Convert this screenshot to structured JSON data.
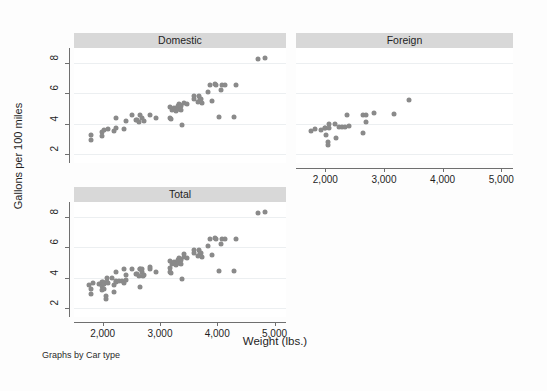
{
  "figure": {
    "note": "Graphs by Car type",
    "xtitle": "Weight (lbs.)",
    "ytitle": "Gallons per 100 miles",
    "bg_color": "#fdfdfd",
    "panel_header_color": "#d8d8d8",
    "marker_color": "#8a8a8a",
    "axis_color": "#6f6f6f",
    "grid_color": "#eceff1"
  },
  "axes": {
    "x": {
      "label": "Weight (lbs.)",
      "min": 1500,
      "max": 5200,
      "ticks": [
        2000,
        3000,
        4000,
        5000
      ],
      "tick_labels": [
        "2,000",
        "3,000",
        "4,000",
        "5,000"
      ]
    },
    "y": {
      "label": "Gallons per 100 miles",
      "min": 1.4,
      "max": 9.0,
      "ticks": [
        2,
        4,
        6,
        8
      ],
      "tick_labels": [
        "2",
        "4",
        "6",
        "8"
      ]
    }
  },
  "chart_data": {
    "type": "scatter",
    "title": "",
    "xlabel": "Weight (lbs.)",
    "ylabel": "Gallons per 100 miles",
    "xlim": [
      1500,
      5200
    ],
    "ylim": [
      1.4,
      9.0
    ],
    "xticks": [
      2000,
      3000,
      4000,
      5000
    ],
    "yticks": [
      2,
      4,
      6,
      8
    ],
    "grid": "horizontal",
    "legend": "none",
    "note": "Graphs by Car type",
    "panels": [
      {
        "name": "Domestic",
        "title": "Domestic",
        "show_y_axis": true,
        "show_x_axis": false,
        "points": [
          [
            1800,
            3.23
          ],
          [
            1800,
            2.95
          ],
          [
            1980,
            3.19
          ],
          [
            1980,
            3.47
          ],
          [
            2020,
            3.57
          ],
          [
            2100,
            3.66
          ],
          [
            2200,
            3.5
          ],
          [
            2230,
            3.72
          ],
          [
            2240,
            4.35
          ],
          [
            2370,
            3.66
          ],
          [
            2410,
            4.2
          ],
          [
            2520,
            4.55
          ],
          [
            2580,
            4.23
          ],
          [
            2600,
            4.23
          ],
          [
            2640,
            4.14
          ],
          [
            2650,
            4.55
          ],
          [
            2690,
            4.4
          ],
          [
            2730,
            4.16
          ],
          [
            2830,
            4.55
          ],
          [
            2930,
            4.38
          ],
          [
            3170,
            4.4
          ],
          [
            3180,
            5.1
          ],
          [
            3200,
            4.32
          ],
          [
            3210,
            4.91
          ],
          [
            3250,
            5.01
          ],
          [
            3260,
            4.99
          ],
          [
            3280,
            4.85
          ],
          [
            3290,
            5.05
          ],
          [
            3300,
            5.04
          ],
          [
            3310,
            5.2
          ],
          [
            3320,
            4.94
          ],
          [
            3330,
            5.3
          ],
          [
            3340,
            4.99
          ],
          [
            3350,
            5.25
          ],
          [
            3360,
            5.15
          ],
          [
            3370,
            4.88
          ],
          [
            3380,
            3.93
          ],
          [
            3420,
            5.35
          ],
          [
            3470,
            5.3
          ],
          [
            3600,
            5.6
          ],
          [
            3600,
            5.85
          ],
          [
            3670,
            5.45
          ],
          [
            3690,
            5.85
          ],
          [
            3700,
            5.6
          ],
          [
            3720,
            5.65
          ],
          [
            3740,
            5.35
          ],
          [
            3830,
            6.1
          ],
          [
            3880,
            6.55
          ],
          [
            3900,
            5.5
          ],
          [
            3960,
            6.6
          ],
          [
            3970,
            6.55
          ],
          [
            4030,
            4.45
          ],
          [
            4060,
            6.25
          ],
          [
            4080,
            6.55
          ],
          [
            4130,
            6.55
          ],
          [
            4290,
            4.45
          ],
          [
            4330,
            6.55
          ],
          [
            4720,
            8.3
          ],
          [
            4840,
            8.35
          ]
        ]
      },
      {
        "name": "Foreign",
        "title": "Foreign",
        "show_y_axis": false,
        "show_x_axis": true,
        "points": [
          [
            1760,
            3.5
          ],
          [
            1830,
            3.63
          ],
          [
            1930,
            3.6
          ],
          [
            1990,
            3.7
          ],
          [
            2000,
            3.7
          ],
          [
            2020,
            3.25
          ],
          [
            2050,
            2.8
          ],
          [
            2050,
            2.6
          ],
          [
            2070,
            4.0
          ],
          [
            2070,
            3.72
          ],
          [
            2160,
            3.95
          ],
          [
            2190,
            3.05
          ],
          [
            2240,
            3.8
          ],
          [
            2280,
            3.78
          ],
          [
            2330,
            3.8
          ],
          [
            2370,
            4.55
          ],
          [
            2400,
            3.83
          ],
          [
            2650,
            3.4
          ],
          [
            2650,
            4.55
          ],
          [
            2690,
            4.55
          ],
          [
            2700,
            4.08
          ],
          [
            2830,
            4.7
          ],
          [
            3170,
            4.65
          ],
          [
            3420,
            5.55
          ]
        ]
      },
      {
        "name": "Total",
        "title": "Total",
        "show_y_axis": true,
        "show_x_axis": true,
        "points": [
          [
            1760,
            3.5
          ],
          [
            1800,
            3.23
          ],
          [
            1800,
            2.95
          ],
          [
            1830,
            3.63
          ],
          [
            1930,
            3.6
          ],
          [
            1980,
            3.19
          ],
          [
            1980,
            3.47
          ],
          [
            1990,
            3.7
          ],
          [
            2000,
            3.7
          ],
          [
            2020,
            3.57
          ],
          [
            2020,
            3.25
          ],
          [
            2050,
            2.8
          ],
          [
            2050,
            2.6
          ],
          [
            2070,
            4.0
          ],
          [
            2070,
            3.72
          ],
          [
            2100,
            3.66
          ],
          [
            2160,
            3.95
          ],
          [
            2190,
            3.05
          ],
          [
            2200,
            3.5
          ],
          [
            2230,
            3.72
          ],
          [
            2240,
            4.35
          ],
          [
            2240,
            3.8
          ],
          [
            2280,
            3.78
          ],
          [
            2330,
            3.8
          ],
          [
            2370,
            3.66
          ],
          [
            2370,
            4.55
          ],
          [
            2400,
            3.83
          ],
          [
            2410,
            4.2
          ],
          [
            2520,
            4.55
          ],
          [
            2580,
            4.23
          ],
          [
            2600,
            4.23
          ],
          [
            2640,
            4.14
          ],
          [
            2650,
            4.55
          ],
          [
            2650,
            3.4
          ],
          [
            2650,
            4.55
          ],
          [
            2690,
            4.4
          ],
          [
            2690,
            4.55
          ],
          [
            2700,
            4.08
          ],
          [
            2730,
            4.16
          ],
          [
            2830,
            4.55
          ],
          [
            2830,
            4.7
          ],
          [
            2930,
            4.38
          ],
          [
            3170,
            4.4
          ],
          [
            3170,
            4.65
          ],
          [
            3180,
            5.1
          ],
          [
            3200,
            4.32
          ],
          [
            3210,
            4.91
          ],
          [
            3250,
            5.01
          ],
          [
            3260,
            4.99
          ],
          [
            3280,
            4.85
          ],
          [
            3290,
            5.05
          ],
          [
            3300,
            5.04
          ],
          [
            3310,
            5.2
          ],
          [
            3320,
            4.94
          ],
          [
            3330,
            5.3
          ],
          [
            3340,
            4.99
          ],
          [
            3350,
            5.25
          ],
          [
            3360,
            5.15
          ],
          [
            3370,
            4.88
          ],
          [
            3380,
            3.93
          ],
          [
            3420,
            5.35
          ],
          [
            3420,
            5.55
          ],
          [
            3470,
            5.3
          ],
          [
            3600,
            5.6
          ],
          [
            3600,
            5.85
          ],
          [
            3670,
            5.45
          ],
          [
            3690,
            5.85
          ],
          [
            3700,
            5.6
          ],
          [
            3720,
            5.65
          ],
          [
            3740,
            5.35
          ],
          [
            3830,
            6.1
          ],
          [
            3880,
            6.55
          ],
          [
            3900,
            5.5
          ],
          [
            3960,
            6.6
          ],
          [
            3970,
            6.55
          ],
          [
            4030,
            4.45
          ],
          [
            4060,
            6.25
          ],
          [
            4080,
            6.55
          ],
          [
            4130,
            6.55
          ],
          [
            4290,
            4.45
          ],
          [
            4330,
            6.55
          ],
          [
            4720,
            8.3
          ],
          [
            4840,
            8.35
          ]
        ]
      }
    ]
  }
}
